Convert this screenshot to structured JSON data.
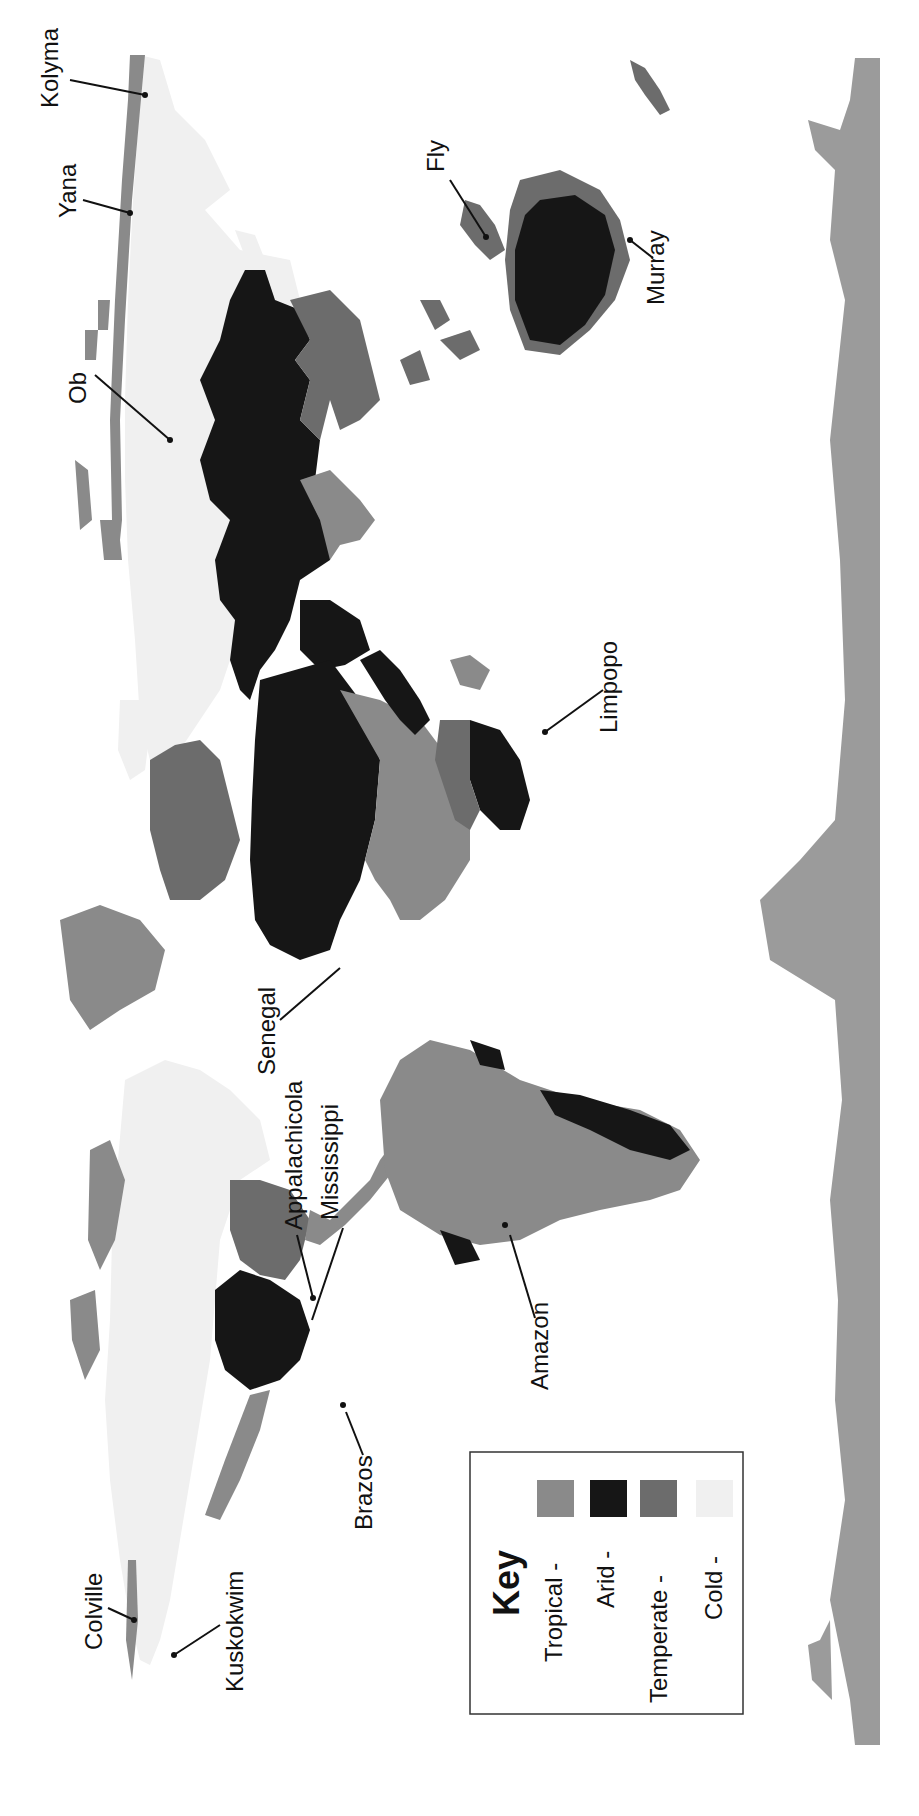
{
  "colors": {
    "tropical": "#8a8a8a",
    "arid": "#161616",
    "temperate": "#6c6c6c",
    "cold": "#f0f0f0",
    "ocean_land_default": "#9b9b9b",
    "background": "#ffffff"
  },
  "legend": {
    "title": "Key",
    "items": [
      {
        "label": "Tropical -",
        "color": "#8a8a8a"
      },
      {
        "label": "Arid -",
        "color": "#161616"
      },
      {
        "label": "Temperate -",
        "color": "#6c6c6c"
      },
      {
        "label": "Cold -",
        "color": "#f0f0f0"
      }
    ]
  },
  "rivers": {
    "kolyma": "Kolyma",
    "yana": "Yana",
    "ob": "Ob",
    "fly": "Fly",
    "murray": "Murray",
    "limpopo": "Limpopo",
    "senegal": "Senegal",
    "appalachicola": "Appalachicola",
    "mississippi": "Mississippi",
    "amazon": "Amazon",
    "brazos": "Brazos",
    "colville": "Colville",
    "kuskokwim": "Kuskokwim"
  }
}
